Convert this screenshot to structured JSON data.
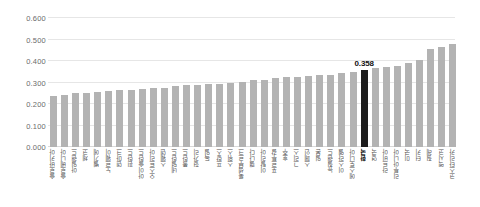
{
  "chart_data": {
    "type": "bar",
    "title": "",
    "subtitle": "",
    "xlabel": "",
    "ylabel": "",
    "ylim": [
      0.0,
      0.6
    ],
    "ytick_labels": [
      "0.600",
      "0.500",
      "0.400",
      "0.300",
      "0.200",
      "0.100",
      "0.000"
    ],
    "ytick_values": [
      0.6,
      0.5,
      0.4,
      0.3,
      0.2,
      0.1,
      0.0
    ],
    "grid": true,
    "legend": "none",
    "highlight_category": "한국",
    "highlight_value": 0.358,
    "highlight_label": "0.358",
    "bar_color": "#b3b3b3",
    "highlight_color": "#1c1c1c",
    "grid_color": "#e6e6e6",
    "categories": [
      "슬로바키아",
      "슬로베니아",
      "아일랜드",
      "체코",
      "벨기에",
      "노르웨이",
      "덴마크",
      "핀란드",
      "아이슬란드",
      "오스트리아",
      "스웨덴",
      "네덜란드",
      "폴란드",
      "헝가리",
      "독일",
      "프랑스",
      "스위스",
      "룩셈부르크",
      "캘나다",
      "이탈리아",
      "포르투갈",
      "호주",
      "그리스",
      "스페인",
      "일본",
      "뉴질랜드",
      "이스라엘",
      "에스토니아",
      "한국",
      "영국",
      "라트비아",
      "리투아니아",
      "미국",
      "터키",
      "칠레",
      "멕시코",
      "코스타리카"
    ],
    "values": [
      0.236,
      0.244,
      0.251,
      0.253,
      0.258,
      0.262,
      0.263,
      0.266,
      0.268,
      0.275,
      0.276,
      0.285,
      0.288,
      0.289,
      0.294,
      0.295,
      0.296,
      0.304,
      0.31,
      0.313,
      0.32,
      0.325,
      0.327,
      0.33,
      0.334,
      0.337,
      0.344,
      0.35,
      0.358,
      0.366,
      0.374,
      0.378,
      0.39,
      0.404,
      0.454,
      0.466,
      0.479
    ]
  }
}
